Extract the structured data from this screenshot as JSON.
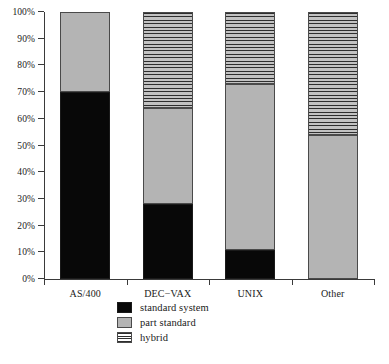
{
  "chart_data": {
    "type": "bar",
    "title": "",
    "subtitle": "",
    "xlabel": "",
    "ylabel": "",
    "stacked": true,
    "stack_total": 100,
    "grid": false,
    "legend_position": "bottom-center",
    "ylim": [
      0,
      100
    ],
    "ytick_labels": [
      "0%",
      "10%",
      "20%",
      "30%",
      "40%",
      "50%",
      "60%",
      "70%",
      "80%",
      "90%",
      "100%"
    ],
    "ytick_values": [
      0,
      10,
      20,
      30,
      40,
      50,
      60,
      70,
      80,
      90,
      100
    ],
    "categories": [
      "AS/400",
      "DEC−VAX",
      "UNIX",
      "Other"
    ],
    "series": [
      {
        "name": "standard system",
        "pattern": "solid-black",
        "color": "#080808",
        "values": [
          70,
          28,
          11,
          0
        ]
      },
      {
        "name": "part standard",
        "pattern": "solid-grey",
        "color": "#b4b4b4",
        "values": [
          30,
          36,
          62,
          54
        ]
      },
      {
        "name": "hybrid",
        "pattern": "horizontal-lines",
        "color": "#c2c2c2",
        "values": [
          0,
          36,
          27,
          46
        ]
      }
    ]
  },
  "legend": {
    "items": [
      {
        "label": "standard system",
        "swatch": "swatch-black-icon"
      },
      {
        "label": "part standard",
        "swatch": "swatch-grey-icon"
      },
      {
        "label": "hybrid",
        "swatch": "swatch-striped-icon"
      }
    ]
  },
  "caption": ""
}
